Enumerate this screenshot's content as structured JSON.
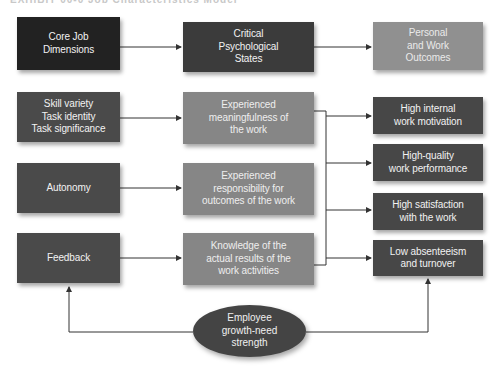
{
  "caption": "EXHIBIT 00-0  Job Characteristics Model",
  "headers": {
    "core": "Core Job\nDimensions",
    "critical": "Critical\nPsychological\nStates",
    "outcomes": "Personal\nand Work\nOutcomes"
  },
  "dimensions": [
    {
      "label": "Skill variety\nTask identity\nTask significance"
    },
    {
      "label": "Autonomy"
    },
    {
      "label": "Feedback"
    }
  ],
  "states": [
    {
      "label": "Experienced\nmeaningfulness of\nthe work"
    },
    {
      "label": "Experienced\nresponsibility for\noutcomes of the work"
    },
    {
      "label": "Knowledge of the\nactual results of the\nwork activities"
    }
  ],
  "outcomes": [
    {
      "label": "High internal\nwork motivation"
    },
    {
      "label": "High-quality\nwork performance"
    },
    {
      "label": "High satisfaction\nwith the work"
    },
    {
      "label": "Low absenteeism\nand turnover"
    }
  ],
  "moderator": {
    "label": "Employee\ngrowth-need\nstrength"
  },
  "colors": {
    "core_header": "#222222",
    "critical_header": "#3b3b3b",
    "outcomes_header": "#909090",
    "dimension_box": "#4a4a4a",
    "state_box": "#868686",
    "outcome_box": "#474747",
    "moderator": "#444444",
    "line": "#333333"
  }
}
